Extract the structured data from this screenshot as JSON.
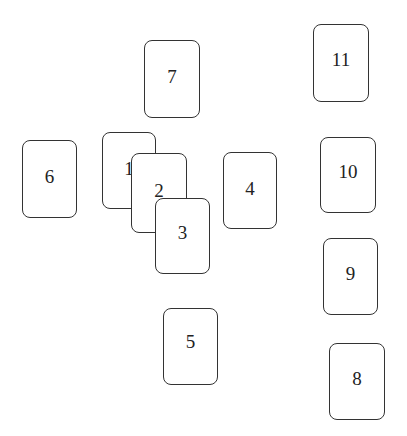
{
  "diagram": {
    "cards": [
      {
        "label": "6",
        "x": 22,
        "y": 140,
        "w": 55,
        "h": 78,
        "z": 1
      },
      {
        "label": "7",
        "x": 144,
        "y": 40,
        "w": 56,
        "h": 78,
        "z": 1
      },
      {
        "label": "1",
        "x": 102,
        "y": 132,
        "w": 54,
        "h": 77,
        "z": 1
      },
      {
        "label": "2",
        "x": 131,
        "y": 153,
        "w": 56,
        "h": 80,
        "z": 2
      },
      {
        "label": "3",
        "x": 155,
        "y": 198,
        "w": 55,
        "h": 76,
        "z": 3
      },
      {
        "label": "4",
        "x": 223,
        "y": 152,
        "w": 54,
        "h": 77,
        "z": 1
      },
      {
        "label": "5",
        "x": 163,
        "y": 308,
        "w": 55,
        "h": 77,
        "z": 1
      },
      {
        "label": "11",
        "x": 313,
        "y": 24,
        "w": 56,
        "h": 78,
        "z": 1
      },
      {
        "label": "10",
        "x": 320,
        "y": 137,
        "w": 56,
        "h": 76,
        "z": 1
      },
      {
        "label": "9",
        "x": 323,
        "y": 238,
        "w": 55,
        "h": 77,
        "z": 1
      },
      {
        "label": "8",
        "x": 329,
        "y": 343,
        "w": 56,
        "h": 77,
        "z": 1
      }
    ]
  }
}
